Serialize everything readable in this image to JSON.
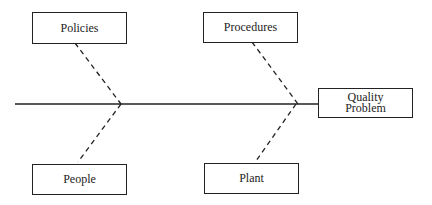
{
  "diagram": {
    "type": "fishbone",
    "effect": {
      "line1": "Quality",
      "line2": "Problem"
    },
    "causes": [
      {
        "label": "Policies",
        "position": "top-left"
      },
      {
        "label": "Procedures",
        "position": "top-right"
      },
      {
        "label": "People",
        "position": "bottom-left"
      },
      {
        "label": "Plant",
        "position": "bottom-right"
      }
    ],
    "colors": {
      "line": "#222222",
      "background": "#ffffff"
    }
  }
}
